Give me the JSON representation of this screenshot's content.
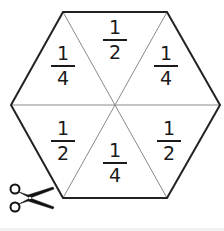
{
  "figure": {
    "shape": "hexagon",
    "outline_color": "#222222",
    "divider_color": "#8a8a8a",
    "vertices": [
      [
        63,
        12
      ],
      [
        167,
        12
      ],
      [
        220,
        105
      ],
      [
        167,
        198
      ],
      [
        63,
        198
      ],
      [
        11,
        105
      ]
    ],
    "center": [
      115,
      105
    ],
    "triangles": [
      {
        "position": "top",
        "numerator": "1",
        "denominator": "2",
        "cx": 115,
        "cy": 40
      },
      {
        "position": "upper-right",
        "numerator": "1",
        "denominator": "4",
        "cx": 166,
        "cy": 66
      },
      {
        "position": "lower-right",
        "numerator": "1",
        "denominator": "2",
        "cx": 169,
        "cy": 141
      },
      {
        "position": "bottom",
        "numerator": "1",
        "denominator": "4",
        "cx": 115,
        "cy": 162
      },
      {
        "position": "lower-left",
        "numerator": "1",
        "denominator": "2",
        "cx": 63,
        "cy": 141
      },
      {
        "position": "upper-left",
        "numerator": "1",
        "denominator": "4",
        "cx": 63,
        "cy": 66
      }
    ]
  },
  "scissors": {
    "icon": "scissors-icon",
    "color": "#111111"
  }
}
